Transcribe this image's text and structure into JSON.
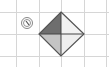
{
  "diagram": {
    "grid": {
      "color": "#d6d6d6",
      "vertical_lines_x": [
        16,
        39,
        61,
        84,
        106
      ],
      "horizontal_lines_y": [
        12,
        34,
        56,
        67
      ]
    },
    "rotation_icon": {
      "label": "rotate-icon",
      "center": [
        27,
        23
      ],
      "color": "#777777"
    },
    "diamond": {
      "top": [
        61,
        12
      ],
      "left": [
        39,
        34
      ],
      "right": [
        84,
        34
      ],
      "bottom": [
        61,
        56
      ],
      "outline_color": "#555555",
      "quadrants": {
        "top_left": "#6e6e6e",
        "top_right": "#f2f2f2",
        "bottom_left": "#c4c4c4",
        "bottom_right": "#eeeeee"
      }
    }
  }
}
